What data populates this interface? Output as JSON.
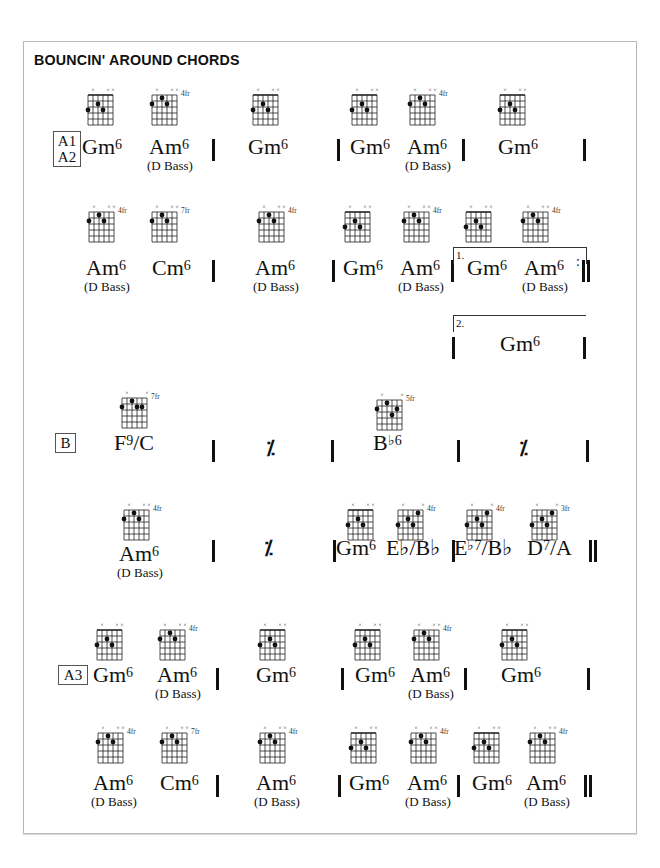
{
  "title": "BOUNCIN' AROUND CHORDS",
  "sections": {
    "a1a2": {
      "label_line1": "A1",
      "label_line2": "A2"
    },
    "b": {
      "label": "B"
    },
    "a3": {
      "label": "A3"
    }
  },
  "symbols": {
    "bass_note": "(D Bass)",
    "simile": "⁒",
    "ending1": "1.",
    "ending2": "2."
  },
  "chords": {
    "gm6": {
      "root": "Gm",
      "ext": "6",
      "fret": ""
    },
    "am6": {
      "root": "Am",
      "ext": "6",
      "fret": "4fr"
    },
    "cm6": {
      "root": "Cm",
      "ext": "6",
      "fret": "7fr"
    },
    "f9c": {
      "root": "F",
      "ext": "9",
      "slash": "/C",
      "fret": "7fr"
    },
    "bb6": {
      "root": "B",
      "ext": "♭6",
      "fret": "5fr"
    },
    "ebbb": {
      "root": "E♭/B♭",
      "fret": "4fr"
    },
    "eb7bb": {
      "root": "E",
      "ext": "♭7",
      "slash": "/B♭",
      "fret": "4fr"
    },
    "d7a": {
      "root": "D",
      "ext": "7",
      "slash": "/A",
      "fret": "3fr"
    }
  },
  "rows": [
    {
      "section": "A1/A2",
      "bars": [
        "Gm6 Am6(D Bass)",
        "Gm6",
        "Gm6 Am6(D Bass)",
        "Gm6"
      ]
    },
    {
      "section": "A1/A2",
      "bars": [
        "Am6(D Bass) Cm6",
        "Am6(D Bass)",
        "Gm6 Am6(D Bass)",
        "1. Gm6 Am6(D Bass) :||"
      ]
    },
    {
      "section": "A1/A2",
      "bars": [
        "2. Gm6"
      ]
    },
    {
      "section": "B",
      "bars": [
        "F9/C",
        "%",
        "B♭6",
        "%"
      ]
    },
    {
      "section": "B",
      "bars": [
        "Am6(D Bass)",
        "%",
        "Gm6 E♭/B♭",
        "E♭7/B♭ D7/A ||"
      ]
    },
    {
      "section": "A3",
      "bars": [
        "Gm6 Am6(D Bass)",
        "Gm6",
        "Gm6 Am6(D Bass)",
        "Gm6"
      ]
    },
    {
      "section": "A3",
      "bars": [
        "Am6(D Bass) Cm6",
        "Am6(D Bass)",
        "Gm6 Am6(D Bass)",
        "Gm6 Am6(D Bass) ||"
      ]
    }
  ]
}
